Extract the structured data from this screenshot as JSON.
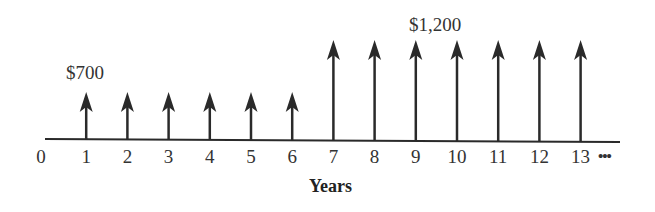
{
  "chart_data": {
    "type": "cash-flow diagram",
    "title": "",
    "xlabel": "Years",
    "x": [
      1,
      2,
      3,
      4,
      5,
      6,
      7,
      8,
      9,
      10,
      11,
      12,
      13
    ],
    "values": [
      700,
      700,
      700,
      700,
      700,
      700,
      1200,
      1200,
      1200,
      1200,
      1200,
      1200,
      1200
    ],
    "tick_labels": [
      "0",
      "1",
      "2",
      "3",
      "4",
      "5",
      "6",
      "7",
      "8",
      "9",
      "10",
      "11",
      "12",
      "13"
    ],
    "continuation": "•••",
    "annotations": [
      {
        "text": "$700",
        "near_year": 1
      },
      {
        "text": "$1,200",
        "near_year": 9
      }
    ]
  },
  "labels": {
    "low": "$700",
    "high": "$1,200",
    "xlabel": "Years",
    "ellipsis": "•••"
  }
}
